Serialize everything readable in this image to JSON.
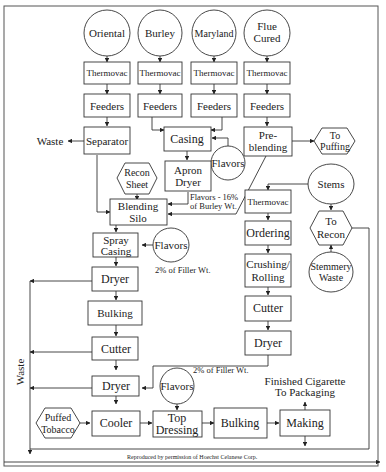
{
  "diagram": {
    "caption": "Reproduced by permission of Hoechst Celanese Corp.",
    "sources": [
      {
        "id": "oriental",
        "label": "Oriental"
      },
      {
        "id": "burley",
        "label": "Burley"
      },
      {
        "id": "maryland",
        "label": "Maryland"
      },
      {
        "id": "flue",
        "label_line1": "Flue",
        "label_line2": "Cured"
      }
    ],
    "nodes": {
      "thermovac": "Thermovac",
      "feeders": "Feeders",
      "separator": "Separator",
      "casing": "Casing",
      "preblending_1": "Pre-",
      "preblending_2": "blending",
      "to_puffing_1": "To",
      "to_puffing_2": "Puffing",
      "waste_left": "Waste",
      "flavors": "Flavors",
      "apron_dryer_1": "Apron",
      "apron_dryer_2": "Dryer",
      "recon_sheet_1": "Recon",
      "recon_sheet_2": "Sheet",
      "blending_silo_1": "Blending",
      "blending_silo_2": "Silo",
      "flavors_note_1": "Flavors - 16%",
      "flavors_note_2": "of Burley Wt.",
      "spray_casing_1": "Spray",
      "spray_casing_2": "Casing",
      "filler_note": "2% of Filler Wt.",
      "dryer": "Dryer",
      "bulking": "Bulking",
      "cutter": "Cutter",
      "ordering": "Ordering",
      "crushing_1": "Crushing/",
      "crushing_2": "Rolling",
      "stems": "Stems",
      "to_recon_1": "To",
      "to_recon_2": "Recon",
      "stemmery_1": "Stemmery",
      "stemmery_2": "Waste",
      "waste_vertical": "Waste",
      "puffed_1": "Puffed",
      "puffed_2": "Tobacco",
      "cooler": "Cooler",
      "top_dressing_1": "Top",
      "top_dressing_2": "Dressing",
      "making": "Making",
      "finished_1": "Finished Cigarette",
      "finished_2": "To Packaging"
    }
  }
}
